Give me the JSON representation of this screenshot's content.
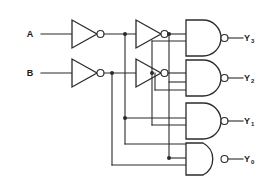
{
  "diagram": {
    "type": "logic-circuit-schematic",
    "line_color": "#2b2b2b",
    "background_color": "#ffffff"
  },
  "inputs": [
    {
      "id": "A",
      "label": "A",
      "x": 34,
      "y": 34
    },
    {
      "id": "B",
      "label": "B",
      "x": 34,
      "y": 73
    }
  ],
  "outputs": [
    {
      "id": "Y3",
      "base": "Y",
      "sub": "3",
      "x": 248,
      "y": 35
    },
    {
      "id": "Y2",
      "base": "Y",
      "sub": "2",
      "x": 248,
      "y": 75
    },
    {
      "id": "Y1",
      "base": "Y",
      "sub": "1",
      "x": 248,
      "y": 118
    },
    {
      "id": "Y0",
      "base": "Y",
      "sub": "0",
      "x": 248,
      "y": 158
    }
  ],
  "inverters": [
    {
      "id": "inv-a1",
      "name": "not-gate-a-first",
      "input_signal": "A",
      "output_signal": "A-bar"
    },
    {
      "id": "inv-a2",
      "name": "not-gate-a-second",
      "input_signal": "A-bar",
      "output_signal": "A"
    },
    {
      "id": "inv-b1",
      "name": "not-gate-b-first",
      "input_signal": "B",
      "output_signal": "B-bar"
    },
    {
      "id": "inv-b2",
      "name": "not-gate-b-second",
      "input_signal": "B-bar",
      "output_signal": "B"
    }
  ],
  "nand_gates": [
    {
      "id": "nand-y3",
      "name": "nand-gate-y3",
      "output": "Y3"
    },
    {
      "id": "nand-y2",
      "name": "nand-gate-y2",
      "output": "Y2"
    },
    {
      "id": "nand-y1",
      "name": "nand-gate-y1",
      "output": "Y1"
    },
    {
      "id": "nand-y0",
      "name": "nand-gate-y0",
      "output": "Y0"
    }
  ]
}
